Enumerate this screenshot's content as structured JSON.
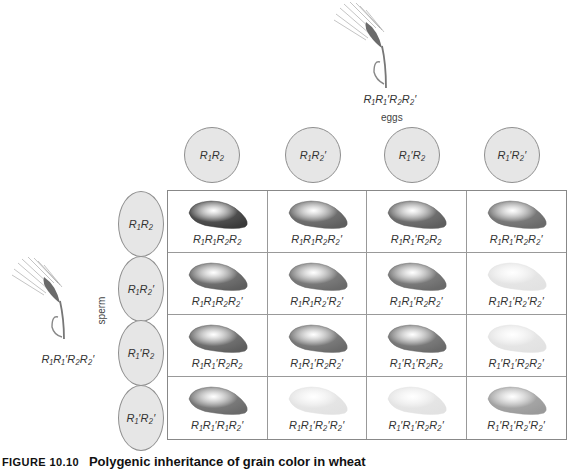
{
  "top_parent": {
    "genotype": "R₁R₁′R₂R₂′",
    "gamete_label": "eggs"
  },
  "left_parent": {
    "genotype": "R₁R₁′R₂R₂′",
    "gamete_label": "sperm"
  },
  "eggs": [
    {
      "label": "R₁R₂"
    },
    {
      "label": "R₁R₂′"
    },
    {
      "label": "R₁′R₂"
    },
    {
      "label": "R₁′R₂′"
    }
  ],
  "sperm": [
    {
      "label": "R₁R₂"
    },
    {
      "label": "R₁R₂′"
    },
    {
      "label": "R₁′R₂"
    },
    {
      "label": "R₁′R₂′"
    }
  ],
  "grid": [
    [
      {
        "genotype": "R₁R₁R₂R₂",
        "shade": "#3a3a3a"
      },
      {
        "genotype": "R₁R₁R₂R₂′",
        "shade": "#5e5e5e"
      },
      {
        "genotype": "R₁R₁′R₂R₂",
        "shade": "#5e5e5e"
      },
      {
        "genotype": "R₁R₁′R₂R₂′",
        "shade": "#6a6a6a"
      }
    ],
    [
      {
        "genotype": "R₁R₁R₂R₂′",
        "shade": "#5e5e5e"
      },
      {
        "genotype": "R₁R₁R₂′R₂′",
        "shade": "#6a6a6a"
      },
      {
        "genotype": "R₁R₁′R₂R₂′",
        "shade": "#6a6a6a"
      },
      {
        "genotype": "R₁R₁′R₂′R₂′",
        "shade": "#e2e2e2"
      }
    ],
    [
      {
        "genotype": "R₁R₁′R₂R₂",
        "shade": "#5e5e5e"
      },
      {
        "genotype": "R₁R₁′R₂R₂′",
        "shade": "#6a6a6a"
      },
      {
        "genotype": "R₁′R₁′R₂R₂",
        "shade": "#6a6a6a"
      },
      {
        "genotype": "R₁′R₁′R₂R₂′",
        "shade": "#e2e2e2"
      }
    ],
    [
      {
        "genotype": "R₁R₁′R₁R₂′",
        "shade": "#6a6a6a"
      },
      {
        "genotype": "R₁R₁′R₂′R₂′",
        "shade": "#e2e2e2"
      },
      {
        "genotype": "R₁′R₁′R₂R₂′",
        "shade": "#e2e2e2"
      },
      {
        "genotype": "R₁′R₁′R₂′R₂′",
        "shade": "#9a9a9a"
      }
    ]
  ],
  "caption": {
    "figure": "FIGURE 10.10",
    "text": "Polygenic inheritance of grain color in wheat"
  }
}
